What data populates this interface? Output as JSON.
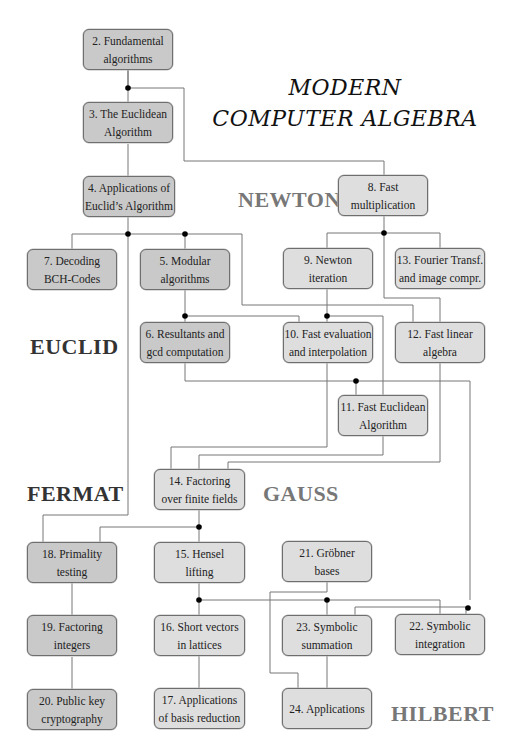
{
  "title": {
    "line1": "MODERN",
    "line2": "COMPUTER ALGEBRA"
  },
  "headings": {
    "newton": "NEWTON",
    "euclid": "EUCLID",
    "fermat": "FERMAT",
    "gauss": "GAUSS",
    "hilbert": "HILBERT"
  },
  "colors": {
    "box_dark": "#c9c9c9",
    "box_light": "#dedede",
    "line": "#777777",
    "junction": "#000000",
    "heading_dark": "#333333",
    "heading_gray": "#777777"
  },
  "chapters": {
    "c2": {
      "line1": "2. Fundamental",
      "line2": "algorithms"
    },
    "c3": {
      "line1": "3. The Euclidean",
      "line2": "Algorithm"
    },
    "c4": {
      "line1": "4. Applications of",
      "line2": "Euclid’s Algorithm"
    },
    "c5": {
      "line1": "5. Modular",
      "line2": "algorithms"
    },
    "c6": {
      "line1": "6. Resultants and",
      "line2": "gcd computation"
    },
    "c7": {
      "line1": "7. Decoding",
      "line2": "BCH-Codes"
    },
    "c8": {
      "line1": "8. Fast",
      "line2": "multiplication"
    },
    "c9": {
      "line1": "9. Newton",
      "line2": "iteration"
    },
    "c10": {
      "line1": "10. Fast evaluation",
      "line2": "and interpolation"
    },
    "c11": {
      "line1": "11. Fast Euclidean",
      "line2": "Algorithm"
    },
    "c12": {
      "line1": "12. Fast linear",
      "line2": "algebra"
    },
    "c13": {
      "line1": "13. Fourier Transf.",
      "line2": "and image compr."
    },
    "c14": {
      "line1": "14. Factoring",
      "line2": "over finite fields"
    },
    "c15": {
      "line1": "15. Hensel",
      "line2": "lifting"
    },
    "c16": {
      "line1": "16. Short vectors",
      "line2": "in lattices"
    },
    "c17": {
      "line1": "17. Applications",
      "line2": "of basis reduction"
    },
    "c18": {
      "line1": "18. Primality",
      "line2": "testing"
    },
    "c19": {
      "line1": "19. Factoring",
      "line2": "integers"
    },
    "c20": {
      "line1": "20. Public key",
      "line2": "cryptography"
    },
    "c21": {
      "line1": "21. Gröbner",
      "line2": "bases"
    },
    "c22": {
      "line1": "22. Symbolic",
      "line2": "integration"
    },
    "c23": {
      "line1": "23. Symbolic",
      "line2": "summation"
    },
    "c24": {
      "line1": "24. Applications",
      "line2": ""
    }
  },
  "dependencies": [
    [
      "c2",
      "c3"
    ],
    [
      "c2",
      "c8"
    ],
    [
      "c3",
      "c4"
    ],
    [
      "c4",
      "c7"
    ],
    [
      "c4",
      "c5"
    ],
    [
      "c4",
      "c18"
    ],
    [
      "c4",
      "c12"
    ],
    [
      "c5",
      "c6"
    ],
    [
      "c5",
      "c10"
    ],
    [
      "c8",
      "c9"
    ],
    [
      "c8",
      "c13"
    ],
    [
      "c8",
      "c12"
    ],
    [
      "c9",
      "c10"
    ],
    [
      "c9",
      "c11"
    ],
    [
      "c6",
      "c11"
    ],
    [
      "c6",
      "c22"
    ],
    [
      "c10",
      "c14"
    ],
    [
      "c11",
      "c14"
    ],
    [
      "c12",
      "c14"
    ],
    [
      "c14",
      "c15"
    ],
    [
      "c14",
      "c18"
    ],
    [
      "c15",
      "c16"
    ],
    [
      "c15",
      "c23"
    ],
    [
      "c15",
      "c22"
    ],
    [
      "c16",
      "c17"
    ],
    [
      "c18",
      "c19"
    ],
    [
      "c19",
      "c20"
    ],
    [
      "c21",
      "c24"
    ],
    [
      "c23",
      "c24"
    ]
  ]
}
